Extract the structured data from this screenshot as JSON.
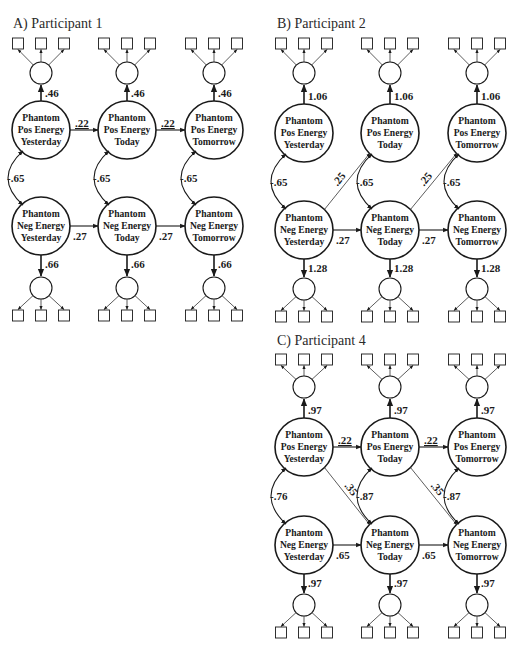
{
  "figure": {
    "panels": [
      {
        "id": "A",
        "title": "A) Participant 1",
        "pos_loading": ".46",
        "neg_loading": ".66",
        "pos_autoregressive": ".22",
        "neg_autoregressive": ".27",
        "correlations": [
          "-.65",
          "-.65",
          "-.65"
        ],
        "cross_lagged": null,
        "cross_lagged_direction": null
      },
      {
        "id": "B",
        "title": "B) Participant 2",
        "pos_loading": "1.06",
        "neg_loading": "1.28",
        "pos_autoregressive": null,
        "neg_autoregressive": ".27",
        "correlations": [
          "-.65",
          "-.65",
          "-.65"
        ],
        "cross_lagged": ".25",
        "cross_lagged_direction": "neg_to_pos"
      },
      {
        "id": "C",
        "title": "C) Participant 4",
        "pos_loading": ".97",
        "neg_loading": ".97",
        "pos_autoregressive": ".22",
        "neg_autoregressive": ".65",
        "correlations": [
          "-.76",
          "-.87",
          "-.87"
        ],
        "cross_lagged": ".35",
        "cross_lagged_direction": "pos_to_neg"
      }
    ],
    "node_labels": {
      "pos": [
        [
          "Phantom",
          "Pos Energy",
          "Yesterday"
        ],
        [
          "Phantom",
          "Pos Energy",
          "Today"
        ],
        [
          "Phantom",
          "Pos Energy",
          "Tomorrow"
        ]
      ],
      "neg": [
        [
          "Phantom",
          "Neg Energy",
          "Yesterday"
        ],
        [
          "Phantom",
          "Neg Energy",
          "Today"
        ],
        [
          "Phantom",
          "Neg Energy",
          "Tomorrow"
        ]
      ]
    },
    "indicator_count_per_latent": 3
  }
}
